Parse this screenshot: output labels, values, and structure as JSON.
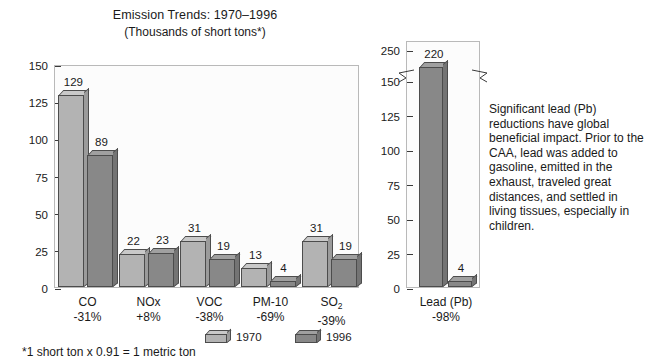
{
  "chart_data": {
    "type": "bar",
    "title": "Emission Trends: 1970–1996",
    "subtitle": "(Thousands of short tons*)",
    "xlabel": "",
    "ylabel": "",
    "grid": false,
    "legend_position": "bottom-right",
    "categories": [
      "CO",
      "NOx",
      "VOC",
      "PM-10",
      "SO2"
    ],
    "category_labels": [
      "CO",
      "NOx",
      "VOC",
      "PM-10",
      "SO₂"
    ],
    "category_changes": [
      "-31%",
      "+8%",
      "-38%",
      "-69%",
      "-39%"
    ],
    "series": [
      {
        "name": "1970",
        "values": [
          129,
          22,
          31,
          13,
          31
        ],
        "color": "#b3b3b3"
      },
      {
        "name": "1996",
        "values": [
          89,
          23,
          19,
          4,
          19
        ],
        "color": "#888888"
      }
    ],
    "ylim": [
      0,
      150
    ],
    "yticks": [
      0,
      25,
      50,
      75,
      100,
      125,
      150
    ],
    "inset": {
      "name": "Lead (Pb)",
      "category_label": "Lead (Pb)",
      "category_change": "-98%",
      "series": [
        {
          "name": "1970",
          "value": 220,
          "color": "#888888"
        },
        {
          "name": "1996",
          "value": 4,
          "color": "#888888"
        }
      ],
      "ylim": [
        0,
        250
      ],
      "yticks": [
        0,
        25,
        50,
        75,
        100,
        125,
        150,
        250
      ],
      "axis_break": true,
      "axis_break_after": 150
    },
    "annotation": "Significant lead (Pb) reductions have global beneficial impact. Prior to the CAA, lead was added to gasoline, emitted in the exhaust, traveled great distances, and settled in living tissues, especially in children.",
    "footnote": "*1 short ton x 0.91 = 1 metric ton"
  },
  "legend": {
    "items": [
      {
        "label": "1970"
      },
      {
        "label": "1996"
      }
    ]
  }
}
